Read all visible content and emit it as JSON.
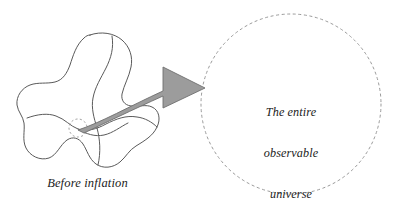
{
  "figure": {
    "background_color": "#ffffff"
  },
  "left_panel": {
    "caption": "Before inflation",
    "blob": {
      "name": "pre-inflation-space-blob",
      "stroke_color": "#5a5a5a",
      "fill_color": "#ffffff",
      "stroke_width": 1
    },
    "patch_marker": {
      "name": "tiny-patch-dashed-circle",
      "stroke_color": "#8d8d8d",
      "center_x": 78,
      "center_y": 128,
      "radius": 9
    }
  },
  "arrow": {
    "name": "inflation-arrow",
    "fill_color": "#9c9c9c",
    "stroke_color": "#6f6f6f",
    "direction": "right",
    "description": "tapered curved arrow from tiny patch to observable universe"
  },
  "right_panel": {
    "circle": {
      "name": "observable-universe-circle",
      "stroke_color": "#9a9a9a",
      "style": "dashed",
      "center_x": 291,
      "center_y": 104,
      "radius": 90
    },
    "label_lines": [
      "The entire",
      "observable",
      "universe"
    ],
    "label_text": "The entire observable universe"
  }
}
